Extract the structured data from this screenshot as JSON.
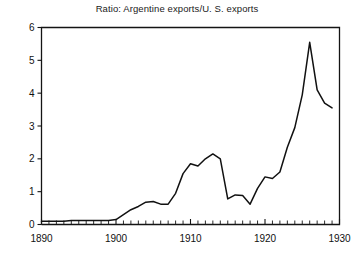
{
  "chart_data": {
    "type": "line",
    "title": "Ratio: Argentine exports/U. S. exports",
    "xlabel": "",
    "ylabel": "",
    "xlim": [
      1890,
      1930
    ],
    "ylim": [
      0,
      6
    ],
    "grid": false,
    "legend": null,
    "y_ticks": [
      0,
      1,
      2,
      3,
      4,
      5,
      6
    ],
    "y_tick_labels": [
      "0",
      "1",
      "2",
      "3",
      "4",
      "5",
      "6"
    ],
    "x_ticks": [
      1890,
      1900,
      1910,
      1920,
      1930
    ],
    "x_tick_labels": [
      "1890",
      "1900",
      "1910",
      "1920",
      "1930"
    ],
    "x_minor_tick_step": 1,
    "series": [
      {
        "name": "Ratio: Argentine exports/U. S. exports",
        "color": "#111111",
        "x": [
          1890,
          1891,
          1892,
          1893,
          1894,
          1895,
          1896,
          1897,
          1898,
          1899,
          1900,
          1901,
          1902,
          1903,
          1904,
          1905,
          1906,
          1907,
          1908,
          1909,
          1910,
          1911,
          1912,
          1913,
          1914,
          1915,
          1916,
          1917,
          1918,
          1919,
          1920,
          1921,
          1922,
          1923,
          1924,
          1925,
          1926,
          1927,
          1928,
          1929
        ],
        "y": [
          0.1,
          0.1,
          0.1,
          0.1,
          0.12,
          0.12,
          0.12,
          0.12,
          0.12,
          0.12,
          0.15,
          0.3,
          0.45,
          0.55,
          0.68,
          0.7,
          0.62,
          0.62,
          0.95,
          1.55,
          1.85,
          1.78,
          2.0,
          2.15,
          2.0,
          0.78,
          0.9,
          0.88,
          0.62,
          1.1,
          1.45,
          1.4,
          1.6,
          2.35,
          2.95,
          3.95,
          5.55,
          4.1,
          3.7,
          3.55
        ]
      }
    ]
  },
  "axes": {
    "y_axis_name": "value-axis",
    "x_axis_name": "year-axis"
  }
}
